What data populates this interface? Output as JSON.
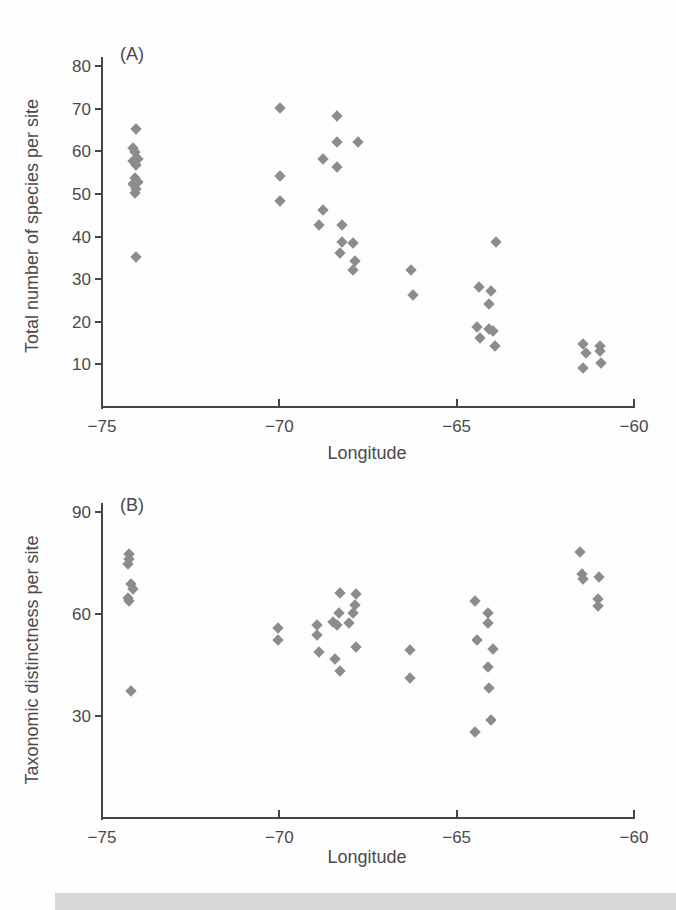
{
  "figure": {
    "background": "#fdfdfd",
    "marker_color": "#8c8c8c",
    "axis_color": "#454545",
    "text_color": "#4a4a4a",
    "bottom_bar_color": "#d7d7d7"
  },
  "chart_data": [
    {
      "type": "scatter",
      "panel_label": "(A)",
      "xlabel": "Longitude",
      "ylabel": "Total number of species per site",
      "xlim": [
        -75,
        -60
      ],
      "ylim": [
        0,
        80
      ],
      "xticks": [
        -75,
        -70,
        -65,
        -60
      ],
      "xtick_labels": [
        "−75",
        "−70",
        "−65",
        "−60"
      ],
      "yticks": [
        10,
        20,
        30,
        40,
        50,
        60,
        70,
        80
      ],
      "ytick_labels": [
        "10",
        "20",
        "30",
        "40",
        "50",
        "60",
        "70",
        "80"
      ],
      "legend": "none",
      "grid": false,
      "marker": {
        "shape": "diamond",
        "color": "#8c8c8c"
      },
      "points": [
        [
          -74.0,
          65
        ],
        [
          -74.1,
          60.5
        ],
        [
          -74.05,
          59.5
        ],
        [
          -73.95,
          58
        ],
        [
          -74.1,
          57.5
        ],
        [
          -74.0,
          56.5
        ],
        [
          -74.05,
          53.5
        ],
        [
          -73.95,
          52.5
        ],
        [
          -74.1,
          52
        ],
        [
          -74.0,
          51
        ],
        [
          -74.05,
          50
        ],
        [
          -74.0,
          35
        ],
        [
          -69.95,
          70
        ],
        [
          -69.95,
          54
        ],
        [
          -69.95,
          48
        ],
        [
          -68.35,
          68
        ],
        [
          -68.35,
          62
        ],
        [
          -67.75,
          62
        ],
        [
          -68.75,
          58
        ],
        [
          -68.35,
          56
        ],
        [
          -68.75,
          46
        ],
        [
          -68.85,
          42.5
        ],
        [
          -68.2,
          42.5
        ],
        [
          -68.2,
          38.5
        ],
        [
          -67.9,
          38.3
        ],
        [
          -68.25,
          36
        ],
        [
          -67.85,
          34
        ],
        [
          -67.9,
          32
        ],
        [
          -66.25,
          32
        ],
        [
          -66.2,
          26
        ],
        [
          -63.85,
          38.5
        ],
        [
          -64.35,
          28
        ],
        [
          -64.0,
          27
        ],
        [
          -64.05,
          24
        ],
        [
          -64.4,
          18.5
        ],
        [
          -64.05,
          18
        ],
        [
          -63.95,
          17.5
        ],
        [
          -64.3,
          16
        ],
        [
          -63.9,
          14
        ],
        [
          -61.42,
          14.5
        ],
        [
          -61.33,
          12.5
        ],
        [
          -60.92,
          14
        ],
        [
          -60.92,
          12.8
        ],
        [
          -61.4,
          9
        ],
        [
          -60.9,
          10
        ]
      ]
    },
    {
      "type": "scatter",
      "panel_label": "(B)",
      "xlabel": "Longitude",
      "ylabel": "Taxonomic distinctness per site",
      "xlim": [
        -75,
        -60
      ],
      "ylim": [
        0,
        90
      ],
      "xticks": [
        -75,
        -70,
        -65,
        -60
      ],
      "xtick_labels": [
        "−75",
        "−70",
        "−65",
        "−60"
      ],
      "yticks": [
        30,
        60,
        90
      ],
      "ytick_labels": [
        "30",
        "60",
        "90"
      ],
      "legend": "none",
      "grid": false,
      "marker": {
        "shape": "diamond",
        "color": "#8c8c8c"
      },
      "points": [
        [
          -74.2,
          77.5
        ],
        [
          -74.2,
          76
        ],
        [
          -74.25,
          74.5
        ],
        [
          -74.15,
          68.5
        ],
        [
          -74.1,
          67
        ],
        [
          -74.25,
          64.5
        ],
        [
          -74.2,
          63.5
        ],
        [
          -74.15,
          37
        ],
        [
          -70.0,
          55.5
        ],
        [
          -70.0,
          52
        ],
        [
          -68.9,
          56.5
        ],
        [
          -68.9,
          53.5
        ],
        [
          -68.85,
          48.5
        ],
        [
          -68.45,
          57.5
        ],
        [
          -68.35,
          56.5
        ],
        [
          -68.25,
          66
        ],
        [
          -68.3,
          60
        ],
        [
          -68.4,
          46.5
        ],
        [
          -68.25,
          43
        ],
        [
          -67.8,
          65.5
        ],
        [
          -67.85,
          62.5
        ],
        [
          -67.9,
          60
        ],
        [
          -68.0,
          57
        ],
        [
          -67.8,
          50
        ],
        [
          -66.3,
          49
        ],
        [
          -66.3,
          41
        ],
        [
          -64.45,
          63.5
        ],
        [
          -64.1,
          60
        ],
        [
          -64.1,
          57
        ],
        [
          -64.4,
          52
        ],
        [
          -63.95,
          49.5
        ],
        [
          -64.1,
          44
        ],
        [
          -64.05,
          38
        ],
        [
          -64.0,
          28.5
        ],
        [
          -64.45,
          25
        ],
        [
          -61.5,
          78
        ],
        [
          -61.45,
          71.5
        ],
        [
          -61.4,
          70
        ],
        [
          -60.95,
          70.5
        ],
        [
          -61.0,
          64
        ],
        [
          -61.0,
          62
        ]
      ]
    }
  ]
}
